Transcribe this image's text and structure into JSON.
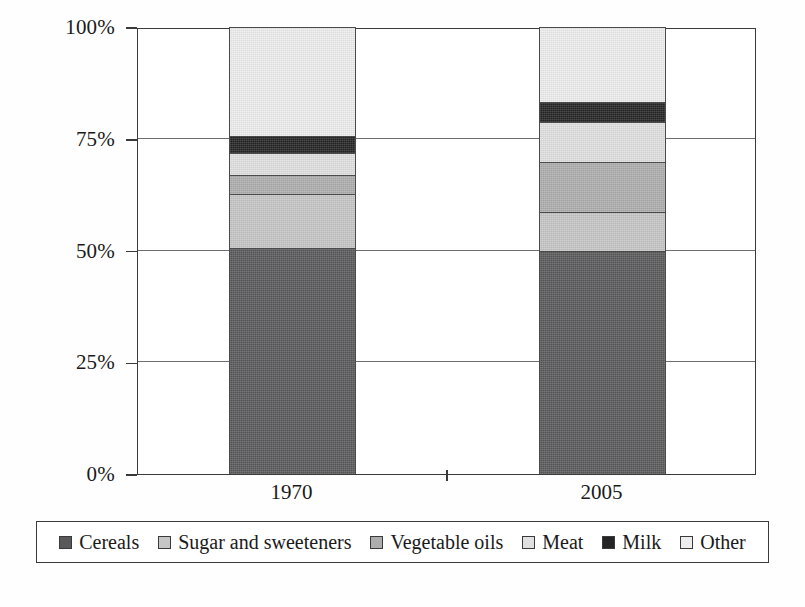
{
  "chart_data": {
    "type": "bar",
    "subtype": "stacked-percentage-column",
    "title": "",
    "subtitle": "",
    "xlabel": "",
    "ylabel": "",
    "categories": [
      "1970",
      "2005"
    ],
    "ylim": [
      0,
      100
    ],
    "yticks": [
      "0%",
      "25%",
      "50%",
      "75%",
      "100%"
    ],
    "ytick_values": [
      0,
      25,
      50,
      75,
      100
    ],
    "grid": true,
    "legend_position": "bottom",
    "stack_order_bottom_to_top": [
      "Cereals",
      "Sugar and sweeteners",
      "Vegetable oils",
      "Meat",
      "Milk",
      "Other"
    ],
    "series": [
      {
        "name": "Cereals",
        "color": "#59595b",
        "values": [
          50.5,
          49.9
        ]
      },
      {
        "name": "Sugar and sweeteners",
        "color": "#c6c6c6",
        "values": [
          12.1,
          8.7
        ]
      },
      {
        "name": "Vegetable oils",
        "color": "#adadad",
        "values": [
          4.3,
          11.2
        ]
      },
      {
        "name": "Meat",
        "color": "#e0e0e0",
        "values": [
          4.9,
          8.9
        ]
      },
      {
        "name": "Milk",
        "color": "#242424",
        "values": [
          3.8,
          4.5
        ]
      },
      {
        "name": "Other",
        "color": "#ededed",
        "values": [
          24.4,
          16.8
        ]
      }
    ],
    "legend_entries": [
      {
        "label": "Cereals",
        "color": "#59595b"
      },
      {
        "label": "Sugar and sweeteners",
        "color": "#c6c6c6"
      },
      {
        "label": "Vegetable oils",
        "color": "#adadad"
      },
      {
        "label": "Meat",
        "color": "#e0e0e0"
      },
      {
        "label": "Milk",
        "color": "#242424"
      },
      {
        "label": "Other",
        "color": "#ededed"
      }
    ],
    "axis_color": "#3a3a3a",
    "gridline_color": "#6e6e6e",
    "background": "#ffffff"
  }
}
